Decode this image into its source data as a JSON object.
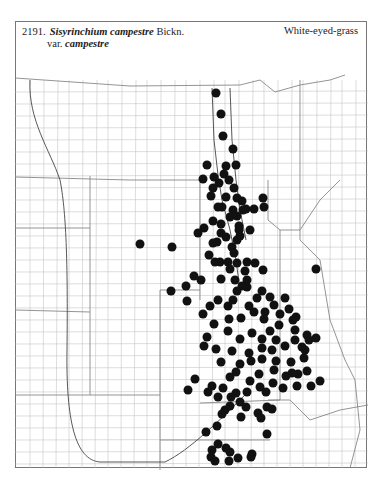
{
  "header": {
    "number": "2191.",
    "genus_species": "Sisyrinchium campestre",
    "author": "Bickn.",
    "var_prefix": "var.",
    "variety": "campestre",
    "common_name": "White-eyed-grass"
  },
  "map": {
    "dot_color": "#111111",
    "line_color": "#999999",
    "dots": [
      [
        216,
        93
      ],
      [
        221,
        114
      ],
      [
        223,
        136
      ],
      [
        233,
        149
      ],
      [
        236,
        165
      ],
      [
        226,
        166
      ],
      [
        207,
        165
      ],
      [
        224,
        174
      ],
      [
        214,
        177
      ],
      [
        229,
        180
      ],
      [
        203,
        179
      ],
      [
        219,
        183
      ],
      [
        213,
        188
      ],
      [
        234,
        188
      ],
      [
        226,
        197
      ],
      [
        211,
        196
      ],
      [
        237,
        198
      ],
      [
        242,
        201
      ],
      [
        246,
        209
      ],
      [
        222,
        207
      ],
      [
        233,
        210
      ],
      [
        243,
        210
      ],
      [
        254,
        209
      ],
      [
        264,
        207
      ],
      [
        263,
        198
      ],
      [
        218,
        207
      ],
      [
        230,
        217
      ],
      [
        237,
        216
      ],
      [
        204,
        228
      ],
      [
        221,
        224
      ],
      [
        213,
        221
      ],
      [
        239,
        226
      ],
      [
        221,
        233
      ],
      [
        239,
        230
      ],
      [
        250,
        230
      ],
      [
        240,
        236
      ],
      [
        226,
        237
      ],
      [
        217,
        242
      ],
      [
        237,
        240
      ],
      [
        232,
        247
      ],
      [
        213,
        243
      ],
      [
        198,
        233
      ],
      [
        234,
        253
      ],
      [
        237,
        263
      ],
      [
        209,
        255
      ],
      [
        220,
        262
      ],
      [
        215,
        262
      ],
      [
        228,
        262
      ],
      [
        247,
        262
      ],
      [
        255,
        263
      ],
      [
        245,
        271
      ],
      [
        230,
        269
      ],
      [
        235,
        280
      ],
      [
        247,
        280
      ],
      [
        221,
        279
      ],
      [
        242,
        286
      ],
      [
        194,
        276
      ],
      [
        201,
        280
      ],
      [
        186,
        286
      ],
      [
        171,
        291
      ],
      [
        187,
        301
      ],
      [
        140,
        244
      ],
      [
        172,
        247
      ],
      [
        263,
        270
      ],
      [
        316,
        269
      ],
      [
        237,
        291
      ],
      [
        247,
        287
      ],
      [
        257,
        298
      ],
      [
        262,
        291
      ],
      [
        270,
        297
      ],
      [
        285,
        298
      ],
      [
        274,
        305
      ],
      [
        265,
        312
      ],
      [
        280,
        314
      ],
      [
        254,
        312
      ],
      [
        249,
        306
      ],
      [
        233,
        300
      ],
      [
        218,
        300
      ],
      [
        228,
        306
      ],
      [
        210,
        306
      ],
      [
        203,
        314
      ],
      [
        241,
        318
      ],
      [
        229,
        319
      ],
      [
        214,
        324
      ],
      [
        264,
        319
      ],
      [
        279,
        325
      ],
      [
        293,
        320
      ],
      [
        289,
        309
      ],
      [
        296,
        317
      ],
      [
        270,
        331
      ],
      [
        295,
        330
      ],
      [
        207,
        337
      ],
      [
        228,
        331
      ],
      [
        240,
        339
      ],
      [
        252,
        333
      ],
      [
        262,
        339
      ],
      [
        276,
        340
      ],
      [
        295,
        340
      ],
      [
        285,
        346
      ],
      [
        272,
        350
      ],
      [
        262,
        348
      ],
      [
        249,
        353
      ],
      [
        232,
        351
      ],
      [
        216,
        349
      ],
      [
        204,
        346
      ],
      [
        221,
        362
      ],
      [
        240,
        364
      ],
      [
        251,
        361
      ],
      [
        262,
        359
      ],
      [
        276,
        361
      ],
      [
        291,
        362
      ],
      [
        304,
        358
      ],
      [
        302,
        347
      ],
      [
        309,
        340
      ],
      [
        316,
        338
      ],
      [
        307,
        335
      ],
      [
        305,
        350
      ],
      [
        298,
        374
      ],
      [
        286,
        376
      ],
      [
        274,
        370
      ],
      [
        259,
        374
      ],
      [
        250,
        381
      ],
      [
        236,
        372
      ],
      [
        230,
        377
      ],
      [
        223,
        388
      ],
      [
        212,
        386
      ],
      [
        195,
        379
      ],
      [
        188,
        390
      ],
      [
        208,
        392
      ],
      [
        218,
        397
      ],
      [
        236,
        393
      ],
      [
        247,
        392
      ],
      [
        260,
        387
      ],
      [
        273,
        383
      ],
      [
        283,
        388
      ],
      [
        297,
        386
      ],
      [
        311,
        386
      ],
      [
        320,
        381
      ],
      [
        307,
        371
      ],
      [
        292,
        373
      ],
      [
        266,
        392
      ],
      [
        246,
        407
      ],
      [
        225,
        410
      ],
      [
        230,
        406
      ],
      [
        217,
        426
      ],
      [
        222,
        414
      ],
      [
        206,
        432
      ],
      [
        218,
        444
      ],
      [
        230,
        452
      ],
      [
        252,
        454
      ],
      [
        241,
        417
      ],
      [
        258,
        413
      ],
      [
        261,
        418
      ],
      [
        267,
        407
      ],
      [
        272,
        409
      ],
      [
        240,
        402
      ],
      [
        231,
        397
      ],
      [
        267,
        434
      ],
      [
        212,
        450
      ],
      [
        215,
        461
      ],
      [
        229,
        461
      ],
      [
        238,
        458
      ],
      [
        251,
        457
      ],
      [
        226,
        448
      ],
      [
        211,
        457
      ]
    ]
  }
}
